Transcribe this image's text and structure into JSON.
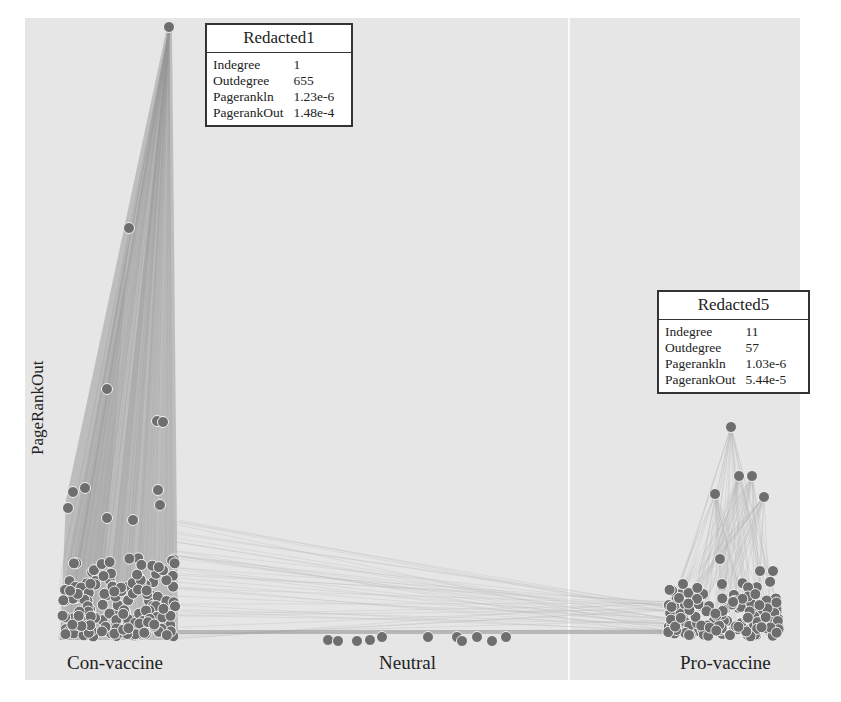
{
  "chart_data": {
    "type": "network",
    "title": "",
    "ylabel": "PageRankOut",
    "xlabel": "",
    "categories": [
      "Con-vaccine",
      "Neutral",
      "Pro-vaccine"
    ],
    "layout_hints": {
      "x_axis": "stance category (Con-vaccine, Neutral, Pro-vaccine)",
      "y_axis": "PageRankOut (higher = further up)",
      "grid": false,
      "divider_between_neutral_and_pro": true
    },
    "highlighted_nodes": [
      {
        "name": "Redacted1",
        "category": "Con-vaccine",
        "Indegree": "1",
        "Outdegree": "655",
        "PagerankIn": "1.23e-6",
        "PagerankOut": "1.48e-4"
      },
      {
        "name": "Redacted5",
        "category": "Pro-vaccine",
        "Indegree": "11",
        "Outdegree": "57",
        "PagerankIn": "1.03e-6",
        "PagerankOut": "5.44e-5"
      }
    ]
  },
  "labels": {
    "ylabel": "PageRankOut",
    "con": "Con-vaccine",
    "neutral": "Neutral",
    "pro": "Pro-vaccine"
  },
  "tooltips": {
    "t1": {
      "title": "Redacted1",
      "rows": [
        {
          "k": "Indegree",
          "v": "1"
        },
        {
          "k": "Outdegree",
          "v": "655"
        },
        {
          "k": "Pagerankln",
          "v": "1.23e-6"
        },
        {
          "k": "PagerankOut",
          "v": "1.48e-4"
        }
      ]
    },
    "t5": {
      "title": "Redacted5",
      "rows": [
        {
          "k": "Indegree",
          "v": "11"
        },
        {
          "k": "Outdegree",
          "v": "57"
        },
        {
          "k": "Pagerankln",
          "v": "1.03e-6"
        },
        {
          "k": "PagerankOut",
          "v": "5.44e-5"
        }
      ]
    }
  },
  "colors": {
    "panel": "#e6e6e6",
    "node": "#6e6e6e",
    "node_stroke": "#f2f2f2",
    "edge_con": "#9a9a9a",
    "edge_pro": "#b5b5b5"
  },
  "nodes": {
    "con_top": [
      [
        169,
        27
      ],
      [
        129,
        228
      ],
      [
        107,
        389
      ],
      [
        157,
        421
      ],
      [
        163,
        422
      ],
      [
        73,
        492
      ],
      [
        85,
        488
      ],
      [
        68,
        508
      ],
      [
        107,
        518
      ],
      [
        133,
        520
      ],
      [
        158,
        490
      ],
      [
        160,
        505
      ]
    ],
    "pro_top": [
      [
        731,
        427
      ],
      [
        739,
        476
      ],
      [
        752,
        476
      ],
      [
        715,
        494
      ],
      [
        764,
        497
      ],
      [
        720,
        559
      ],
      [
        760,
        571
      ],
      [
        773,
        571
      ],
      [
        722,
        584
      ],
      [
        683,
        584
      ],
      [
        679,
        598
      ]
    ],
    "neutral": [
      [
        328,
        640
      ],
      [
        338,
        641
      ],
      [
        357,
        641
      ],
      [
        370,
        640
      ],
      [
        382,
        637
      ],
      [
        428,
        637
      ],
      [
        457,
        637
      ],
      [
        462,
        641
      ],
      [
        477,
        637
      ],
      [
        492,
        641
      ],
      [
        506,
        637
      ]
    ]
  }
}
